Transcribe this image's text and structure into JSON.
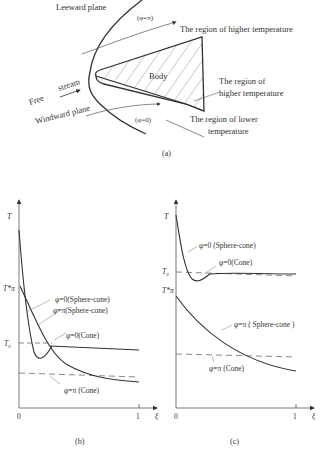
{
  "panel_a": {
    "caption": "(a)",
    "labels": {
      "leeward": "Leeward plane",
      "phi_pi": "(φ=π)",
      "higher_top": "The region of higher temperature",
      "body": "Body",
      "higher_right_1": "The region of",
      "higher_right_2": "higher temperature",
      "free": "Free",
      "stream": "stream",
      "windward": "Windward plane",
      "phi_0": "(φ=0)",
      "lower_1": "The region of lower",
      "lower_2": "temperature"
    }
  },
  "panel_b": {
    "caption": "(b)",
    "y_label": "T",
    "x_label": "ξ",
    "x_ticks": [
      "0",
      "1"
    ],
    "y_marks": {
      "t_pi_star": "T*π",
      "t0": "T₀"
    },
    "curve_labels": {
      "phi0_sc": "φ=0(Sphere-cone)",
      "phipi_sc": "φ=π(Sphere-cone)",
      "phi0_cone": "φ=0(Cone)",
      "phipi_cone": "φ=π (Cone)"
    }
  },
  "panel_c": {
    "caption": "(c)",
    "y_label": "T",
    "x_label": "ξ",
    "x_ticks": [
      "0",
      "1"
    ],
    "y_marks": {
      "t0": "T₀",
      "t_pi_star": "T*π"
    },
    "curve_labels": {
      "phi0_sc": "φ=0 (Sphere-cone)",
      "phi0_cone": "φ=0(Cone)",
      "phipi_sc": "φ=π ( Sphere-cone )",
      "phipi_cone": "φ=π (Cone)"
    }
  }
}
